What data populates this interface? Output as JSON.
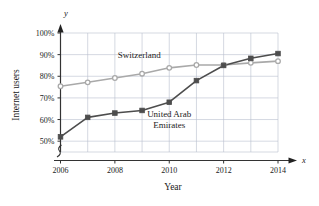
{
  "chart_data": {
    "type": "line",
    "title": "",
    "xlabel": "Year",
    "ylabel": "Internet users",
    "x_axis_variable": "x",
    "y_axis_variable": "y",
    "x": [
      2006,
      2007,
      2008,
      2009,
      2010,
      2011,
      2012,
      2013,
      2014
    ],
    "xlim": [
      2006,
      2014
    ],
    "ylim": [
      45,
      100
    ],
    "x_tick_labels": [
      "2006",
      "2008",
      "2010",
      "2012",
      "2014"
    ],
    "x_tick_values": [
      2006,
      2008,
      2010,
      2012,
      2014
    ],
    "x_minor_gridlines": [
      2007,
      2009,
      2011,
      2013
    ],
    "y_tick_labels": [
      "50%",
      "60%",
      "70%",
      "80%",
      "90%",
      "100%"
    ],
    "y_tick_values": [
      50,
      60,
      70,
      80,
      90,
      100
    ],
    "grid": true,
    "axis_break": true,
    "legend": "inline-labels",
    "series": [
      {
        "name": "Switzerland",
        "color": "#a9a9a9",
        "marker": "circle",
        "label_x": 2008.9,
        "label_y": 88.5,
        "values": [
          75.4,
          77.2,
          79.2,
          81.2,
          83.9,
          85.2,
          85.2,
          86.2,
          87.0
        ]
      },
      {
        "name": "United Arab Emirates",
        "name_line1": "United Arab",
        "name_line2": "Emirates",
        "color": "#4d4d4d",
        "marker": "square",
        "label_x": 2010.0,
        "label_y": 61.0,
        "values": [
          52.0,
          61.0,
          63.0,
          64.2,
          68.0,
          78.0,
          85.0,
          88.3,
          90.5
        ]
      }
    ]
  },
  "labels": {
    "x_axis_title": "Year",
    "y_axis_title": "Internet users",
    "x_axis_variable": "x",
    "y_axis_variable": "y",
    "series_switzerland": "Switzerland",
    "series_uae_line1": "United Arab",
    "series_uae_line2": "Emirates"
  }
}
